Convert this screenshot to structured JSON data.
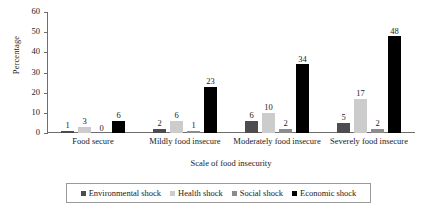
{
  "chart_data": {
    "type": "bar",
    "title": "",
    "xlabel": "Scale of food insecurity",
    "ylabel": "Percentage",
    "ylim": [
      0,
      60
    ],
    "ytick_labels": [
      "0",
      "10",
      "20",
      "30",
      "40",
      "50",
      "60"
    ],
    "ytick_values": [
      0,
      10,
      20,
      30,
      40,
      50,
      60
    ],
    "grid": false,
    "legend_position": "bottom",
    "categories": [
      "Food secure",
      "Mildly food insecure",
      "Moderately food insecure",
      "Severely food insecure"
    ],
    "series": [
      {
        "name": "Environmental shock",
        "color": "#4d4d4f",
        "values": [
          1,
          2,
          6,
          5
        ]
      },
      {
        "name": "Health shock",
        "color": "#cccccc",
        "values": [
          3,
          6,
          10,
          17
        ]
      },
      {
        "name": "Social shock",
        "color": "#8c8c8c",
        "values": [
          0,
          1,
          2,
          2
        ]
      },
      {
        "name": "Economic shock",
        "color": "#000000",
        "values": [
          6,
          23,
          34,
          48
        ]
      }
    ]
  }
}
